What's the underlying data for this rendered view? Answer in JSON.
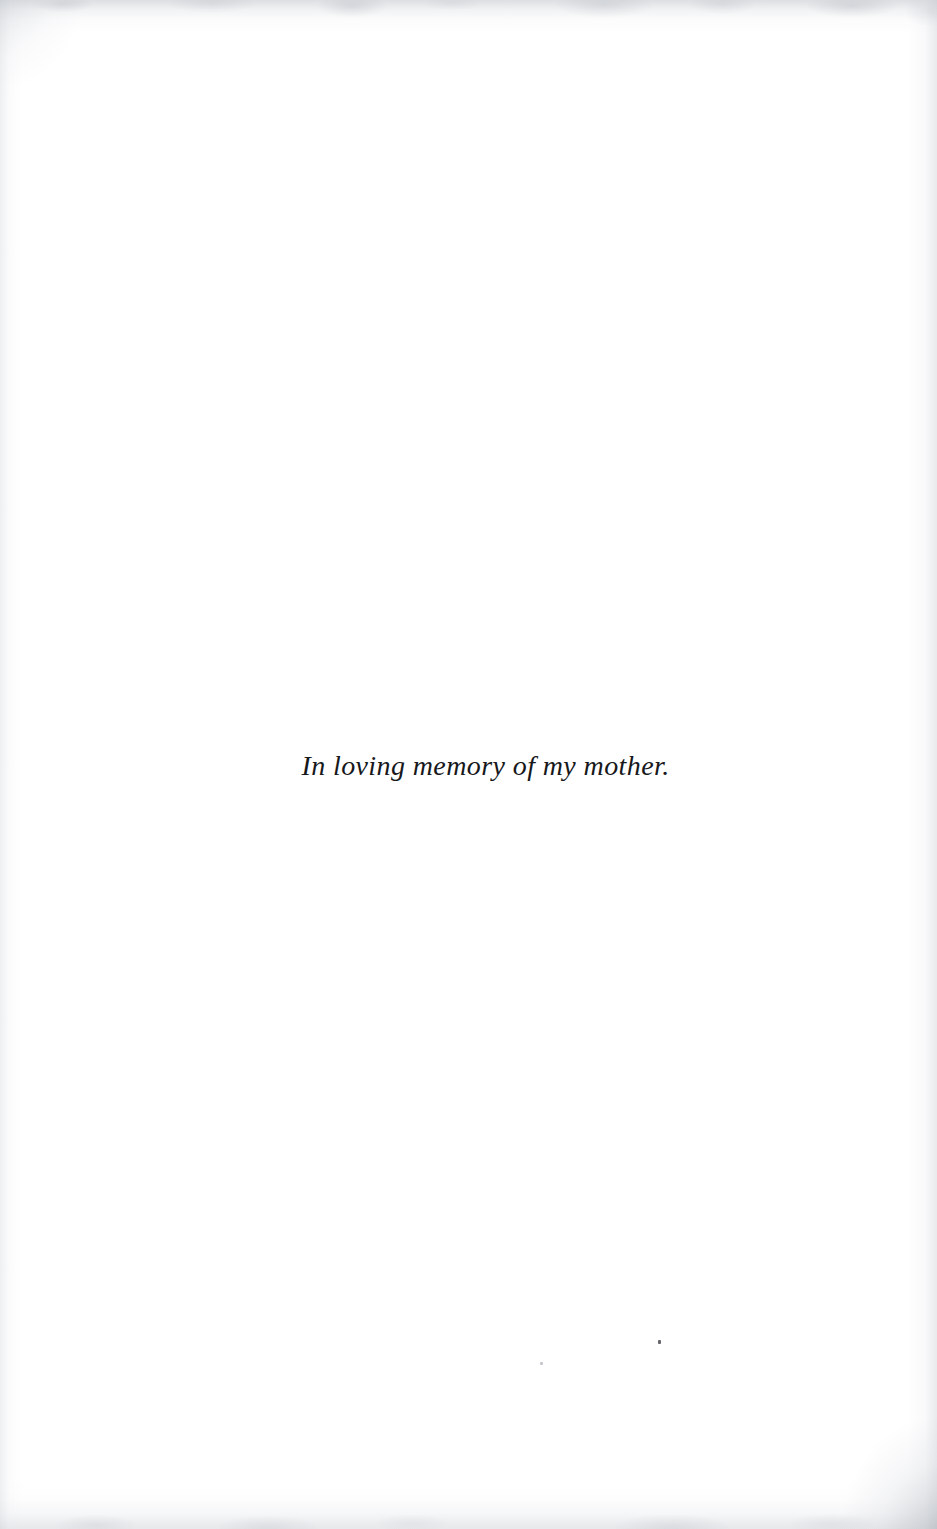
{
  "page": {
    "kind": "book-dedication-page",
    "width": 937,
    "height": 1529,
    "background_color": "#ffffff",
    "ink_color": "#17181b"
  },
  "dedication": {
    "text": "In loving memory of my mother.",
    "style": "italic-serif",
    "alignment": "center"
  },
  "artifacts": {
    "edge_shade_color": "#bcc0c6",
    "speck_dark_color": "#4a4c50",
    "speck_light_color": "#b9bcc1"
  }
}
